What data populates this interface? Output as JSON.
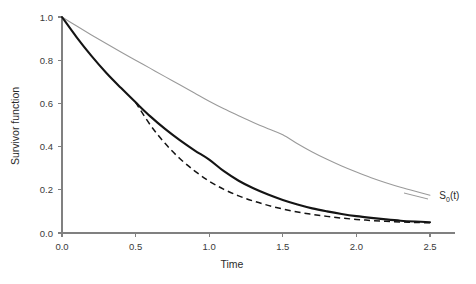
{
  "chart_data": {
    "type": "line",
    "title": "",
    "subtitle": "",
    "xlabel": "Time",
    "ylabel": "Survivor function",
    "xlim": [
      0.0,
      2.6
    ],
    "ylim": [
      0.0,
      1.05
    ],
    "grid": false,
    "legend_position": "inline-annotation",
    "xticks": [
      "0.0",
      "0.5",
      "1.0",
      "1.5",
      "2.0",
      "2.5"
    ],
    "xtick_values": [
      0.0,
      0.5,
      1.0,
      1.5,
      2.0,
      2.5
    ],
    "yticks": [
      "0.0",
      "0.2",
      "0.4",
      "0.6",
      "0.8",
      "1.0"
    ],
    "ytick_values": [
      0.0,
      0.2,
      0.4,
      0.6,
      0.8,
      1.0
    ],
    "annotations": [
      {
        "text": "S0(t)",
        "base": "S",
        "subscript": "0",
        "suffix": "(t)",
        "x": 2.55,
        "y": 0.175,
        "points_to_series": "baseline-survivor"
      }
    ],
    "series": [
      {
        "name": "baseline-survivor",
        "label": "S0(t)",
        "style": "solid-thin",
        "color": "#9a9a9a",
        "x": [
          0.0,
          0.1,
          0.2,
          0.3,
          0.4,
          0.5,
          0.6,
          0.7,
          0.8,
          0.9,
          1.0,
          1.1,
          1.2,
          1.3,
          1.4,
          1.5,
          1.6,
          1.7,
          1.8,
          1.9,
          2.0,
          2.1,
          2.2,
          2.3,
          2.4,
          2.5
        ],
        "y": [
          1.0,
          0.958,
          0.917,
          0.877,
          0.838,
          0.8,
          0.762,
          0.724,
          0.686,
          0.648,
          0.61,
          0.575,
          0.543,
          0.512,
          0.483,
          0.455,
          0.413,
          0.375,
          0.341,
          0.31,
          0.282,
          0.256,
          0.233,
          0.212,
          0.193,
          0.175
        ]
      },
      {
        "name": "treatment-survivor-solid",
        "label": "",
        "style": "solid-thick",
        "color": "#141414",
        "x": [
          0.0,
          0.1,
          0.2,
          0.3,
          0.4,
          0.5,
          0.6,
          0.7,
          0.8,
          0.9,
          1.0,
          1.1,
          1.2,
          1.3,
          1.4,
          1.5,
          1.6,
          1.7,
          1.8,
          1.9,
          2.0,
          2.1,
          2.2,
          2.3,
          2.4,
          2.5
        ],
        "y": [
          1.0,
          0.906,
          0.82,
          0.742,
          0.672,
          0.605,
          0.54,
          0.482,
          0.43,
          0.383,
          0.34,
          0.286,
          0.242,
          0.207,
          0.178,
          0.153,
          0.132,
          0.114,
          0.1,
          0.088,
          0.078,
          0.07,
          0.063,
          0.057,
          0.053,
          0.05
        ]
      },
      {
        "name": "treatment-survivor-dashed",
        "label": "",
        "style": "dashed",
        "color": "#141414",
        "x": [
          0.5,
          0.6,
          0.7,
          0.8,
          0.9,
          1.0,
          1.1,
          1.2,
          1.3,
          1.4,
          1.5,
          1.6,
          1.7,
          1.8,
          1.9,
          2.0,
          2.1,
          2.2,
          2.3,
          2.4,
          2.5
        ],
        "y": [
          0.605,
          0.5,
          0.415,
          0.345,
          0.288,
          0.24,
          0.202,
          0.172,
          0.148,
          0.128,
          0.111,
          0.097,
          0.086,
          0.077,
          0.069,
          0.063,
          0.058,
          0.054,
          0.051,
          0.049,
          0.047
        ]
      }
    ]
  }
}
